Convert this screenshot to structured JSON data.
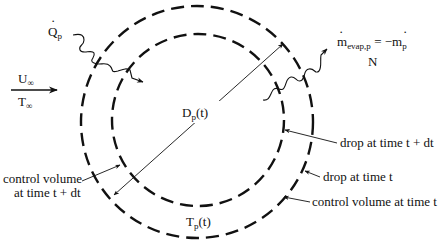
{
  "diagram": {
    "type": "evaporating droplet control volume schematic",
    "labels": {
      "heat_flux": {
        "main": "Q",
        "dot": "·",
        "sub": "p"
      },
      "freestream_velocity": {
        "main": "U",
        "sub": "∞"
      },
      "freestream_temperature": {
        "main": "T",
        "sub": "∞"
      },
      "evap_rate": {
        "lhs_main": "m",
        "lhs_sub": "evap,p",
        "equals": " = −",
        "rhs_main": "m",
        "rhs_sub": "p",
        "dot": "·"
      },
      "evap_rate_extra": "N",
      "diameter": {
        "main": "D",
        "sub": "p",
        "arg": "(t)"
      },
      "temperature": {
        "main": "T",
        "sub": "p",
        "arg": "(t)"
      },
      "drop_t_dt": "drop at time t + dt",
      "drop_t": "drop at time t",
      "cv_t": "control volume at time t",
      "cv_t_dt_line1": "control volume",
      "cv_t_dt_line2": "at time t + dt"
    },
    "shapes": {
      "outer_circle": {
        "name": "control volume at time t",
        "cx": 197,
        "cy": 122,
        "r": 116,
        "style": "dashed"
      },
      "inner_circle": {
        "name": "drop at time t + dt",
        "cx": 198,
        "cy": 120,
        "r": 86,
        "style": "dashed"
      }
    },
    "colors": {
      "ink": "#111111",
      "background": "#ffffff"
    }
  }
}
